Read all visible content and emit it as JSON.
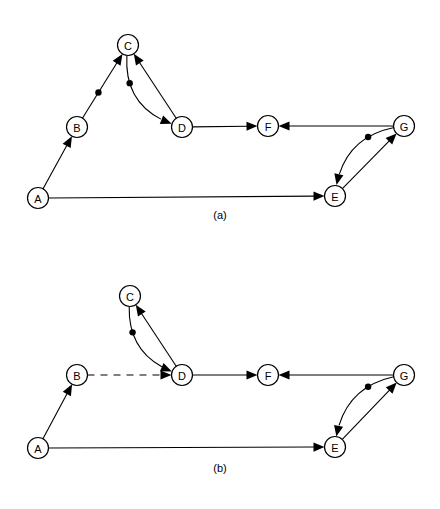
{
  "figure": {
    "background_color": "#ffffff",
    "stroke_color": "#000000",
    "node_fill": "#ffffff",
    "width": 440,
    "height": 509
  },
  "panels": [
    {
      "id": "a",
      "caption": "(a)",
      "caption_x": 220,
      "caption_y": 219,
      "nodes": [
        {
          "id": "A",
          "label": "A",
          "x": 38,
          "y": 198
        },
        {
          "id": "B",
          "label": "B",
          "x": 77,
          "y": 127
        },
        {
          "id": "C",
          "label": "C",
          "x": 128,
          "y": 45
        },
        {
          "id": "D",
          "label": "D",
          "x": 182,
          "y": 127
        },
        {
          "id": "F",
          "label": "F",
          "x": 268,
          "y": 126
        },
        {
          "id": "E",
          "label": "E",
          "x": 335,
          "y": 196
        },
        {
          "id": "G",
          "label": "G",
          "x": 404,
          "y": 126
        }
      ],
      "edges": [
        {
          "from": "A",
          "to": "B",
          "style": "solid",
          "arrow": true,
          "dot": false,
          "curve": 0
        },
        {
          "from": "B",
          "to": "C",
          "style": "solid",
          "arrow": true,
          "dot": true,
          "curve": 0
        },
        {
          "from": "D",
          "to": "C",
          "style": "solid",
          "arrow": true,
          "dot": false,
          "curve": 0
        },
        {
          "from": "C",
          "to": "D",
          "style": "solid",
          "arrow": true,
          "dot": true,
          "curve": 22
        },
        {
          "from": "D",
          "to": "F",
          "style": "solid",
          "arrow": true,
          "dot": false,
          "curve": 0
        },
        {
          "from": "G",
          "to": "F",
          "style": "solid",
          "arrow": true,
          "dot": false,
          "curve": 0
        },
        {
          "from": "A",
          "to": "E",
          "style": "solid",
          "arrow": true,
          "dot": false,
          "curve": 0
        },
        {
          "from": "E",
          "to": "G",
          "style": "solid",
          "arrow": true,
          "dot": false,
          "curve": 0
        },
        {
          "from": "G",
          "to": "E",
          "style": "solid",
          "arrow": true,
          "dot": true,
          "curve": 20
        }
      ]
    },
    {
      "id": "b",
      "caption": "(b)",
      "caption_x": 220,
      "caption_y": 472,
      "nodes": [
        {
          "id": "A",
          "label": "A",
          "x": 38,
          "y": 448
        },
        {
          "id": "B",
          "label": "B",
          "x": 77,
          "y": 375
        },
        {
          "id": "C",
          "label": "C",
          "x": 130,
          "y": 296
        },
        {
          "id": "D",
          "label": "D",
          "x": 182,
          "y": 375
        },
        {
          "id": "F",
          "label": "F",
          "x": 268,
          "y": 375
        },
        {
          "id": "E",
          "label": "E",
          "x": 335,
          "y": 447
        },
        {
          "id": "G",
          "label": "G",
          "x": 404,
          "y": 375
        }
      ],
      "edges": [
        {
          "from": "A",
          "to": "B",
          "style": "solid",
          "arrow": true,
          "dot": false,
          "curve": 0
        },
        {
          "from": "B",
          "to": "D",
          "style": "dashed",
          "arrow": true,
          "dot": false,
          "curve": 0
        },
        {
          "from": "D",
          "to": "C",
          "style": "solid",
          "arrow": true,
          "dot": false,
          "curve": 0
        },
        {
          "from": "C",
          "to": "D",
          "style": "solid",
          "arrow": true,
          "dot": true,
          "curve": 20
        },
        {
          "from": "D",
          "to": "F",
          "style": "solid",
          "arrow": true,
          "dot": false,
          "curve": 0
        },
        {
          "from": "G",
          "to": "F",
          "style": "solid",
          "arrow": true,
          "dot": false,
          "curve": 0
        },
        {
          "from": "A",
          "to": "E",
          "style": "solid",
          "arrow": true,
          "dot": false,
          "curve": 0
        },
        {
          "from": "E",
          "to": "G",
          "style": "solid",
          "arrow": true,
          "dot": false,
          "curve": 0
        },
        {
          "from": "G",
          "to": "E",
          "style": "solid",
          "arrow": true,
          "dot": true,
          "curve": 20
        }
      ]
    }
  ],
  "geometry": {
    "node_radius": 10.5,
    "arrow_length": 11,
    "arrow_half_width": 4.6,
    "dot_radius": 3.2
  }
}
